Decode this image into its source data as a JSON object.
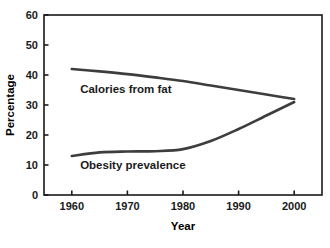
{
  "chart_data": {
    "type": "line",
    "title": "",
    "xlabel": "Year",
    "ylabel": "Percentage",
    "xlim": [
      1955,
      2005
    ],
    "ylim": [
      0,
      60
    ],
    "xticks": [
      1960,
      1970,
      1980,
      1990,
      2000
    ],
    "xtick_labels": [
      "1960",
      "1970",
      "1980",
      "1990",
      "2000"
    ],
    "yticks": [
      0,
      10,
      20,
      30,
      40,
      50,
      60
    ],
    "ytick_labels": [
      "0",
      "10",
      "20",
      "30",
      "40",
      "50",
      "60"
    ],
    "grid": false,
    "legend_position": "inline-annotation",
    "line_color": "#3d3d3d",
    "axis_color": "#1a1a1a",
    "background_color": "#ffffff",
    "series": [
      {
        "name": "Calories from fat",
        "label_text": "Calories from fat",
        "x": [
          1960,
          1965,
          1970,
          1975,
          1980,
          1985,
          1990,
          1995,
          2000
        ],
        "values": [
          42.0,
          41.2,
          40.3,
          39.2,
          38.0,
          36.5,
          35.0,
          33.5,
          32.0
        ]
      },
      {
        "name": "Obesity prevalence",
        "label_text": "Obesity prevalence",
        "x": [
          1960,
          1965,
          1970,
          1975,
          1980,
          1985,
          1990,
          1995,
          2000
        ],
        "values": [
          13.0,
          14.2,
          14.5,
          14.6,
          15.3,
          18.0,
          22.0,
          26.5,
          31.0
        ]
      }
    ]
  },
  "annotations": {
    "calories_label": "Calories from fat",
    "obesity_label": "Obesity prevalence"
  }
}
